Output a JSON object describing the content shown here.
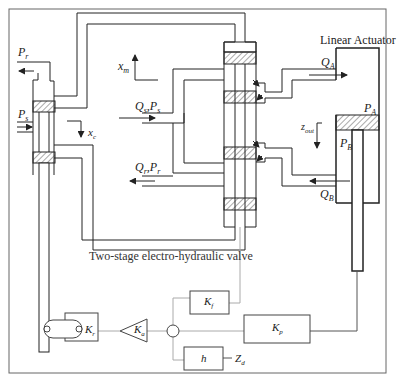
{
  "diagram": {
    "type": "block-schematic",
    "title": "",
    "caption": "Two-stage electro-hydraulic valve",
    "actuator_label": "Linear Actuator",
    "labels": {
      "Pr": {
        "main": "P",
        "sub": "r"
      },
      "Ps": {
        "main": "P",
        "sub": "s"
      },
      "xc": {
        "main": "x",
        "sub": "c"
      },
      "xm": {
        "main": "x",
        "sub": "m"
      },
      "QsPs": {
        "main": "Q",
        "sub": "s",
        "main2": ",P",
        "sub2": "s"
      },
      "QrPr": {
        "main": "Q",
        "sub": "r",
        "main2": ",P",
        "sub2": "r"
      },
      "QA": {
        "main": "Q",
        "sub": "A"
      },
      "QB": {
        "main": "Q",
        "sub": "B"
      },
      "PA": {
        "main": "P",
        "sub": "A"
      },
      "PB": {
        "main": "P",
        "sub": "B"
      },
      "zout": {
        "main": "z",
        "sub": "out"
      }
    },
    "blocks": {
      "Kr": {
        "main": "K",
        "sub": "r"
      },
      "Ka": {
        "main": "K",
        "sub": "a"
      },
      "Kf": {
        "main": "K",
        "sub": "f"
      },
      "Kp": {
        "main": "K",
        "sub": "p"
      },
      "h": {
        "main": "h"
      },
      "Zd": {
        "main": "Z",
        "sub": "d"
      }
    },
    "colors": {
      "line": "#222222",
      "signal_line": "#aaaaaa",
      "hatch": "#555555",
      "frame": "#666666"
    }
  }
}
